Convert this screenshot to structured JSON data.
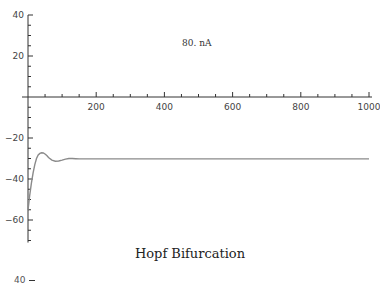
{
  "chart_data": {
    "type": "line",
    "title": "",
    "caption": "Hopf Bifurcation",
    "annotation": "80. nA",
    "xlabel": "",
    "ylabel": "",
    "xlim": [
      0,
      1000
    ],
    "ylim": [
      -70,
      40
    ],
    "x_ticks": [
      200,
      400,
      600,
      800,
      1000
    ],
    "y_ticks": [
      40,
      20,
      -20,
      -40,
      -60
    ],
    "grid": false,
    "legend": null,
    "series": [
      {
        "name": "membrane potential",
        "color": "#8a8a8a",
        "x": [
          0,
          5,
          10,
          15,
          20,
          25,
          30,
          35,
          40,
          45,
          50,
          55,
          60,
          70,
          80,
          90,
          100,
          110,
          120,
          130,
          140,
          150,
          200,
          300,
          400,
          500,
          600,
          700,
          800,
          900,
          1000
        ],
        "y": [
          -55,
          -48,
          -42,
          -37,
          -33,
          -30,
          -28.3,
          -27.5,
          -27.2,
          -27.3,
          -27.8,
          -28.6,
          -29.5,
          -30.8,
          -31.3,
          -31.2,
          -30.8,
          -30.3,
          -30.0,
          -30.0,
          -30.1,
          -30.2,
          -30.2,
          -30.2,
          -30.2,
          -30.2,
          -30.2,
          -30.2,
          -30.2,
          -30.2,
          -30.2
        ]
      }
    ]
  },
  "labels": {
    "annotation": "80. nA",
    "caption": "Hopf Bifurcation",
    "next_plot_top_tick": "40"
  }
}
